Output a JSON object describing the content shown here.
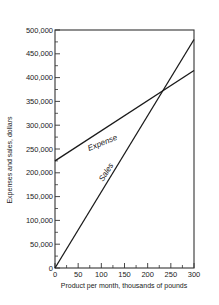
{
  "chart_data": {
    "type": "line",
    "title": "",
    "xlabel": "Product per month, thousands of pounds",
    "ylabel": "Expenses and sales, dollars",
    "xlim": [
      0,
      300
    ],
    "ylim": [
      0,
      500000
    ],
    "x_ticks": [
      0,
      50,
      100,
      150,
      200,
      250,
      300
    ],
    "x_tick_labels": [
      "0",
      "50",
      "100",
      "150",
      "200",
      "250",
      "300"
    ],
    "y_ticks": [
      0,
      50000,
      100000,
      150000,
      200000,
      250000,
      300000,
      350000,
      400000,
      450000,
      500000
    ],
    "y_tick_labels": [
      "0",
      "50,000",
      "100,000",
      "150,000",
      "200,000",
      "250,000",
      "300,000",
      "350,000",
      "400,000",
      "450,000",
      "500,000"
    ],
    "grid": false,
    "legend": "none (inline labels)",
    "series": [
      {
        "name": "Expense",
        "x": [
          0,
          300
        ],
        "values": [
          225000,
          415000
        ],
        "label_pos": {
          "x": 40,
          "y": 280000
        }
      },
      {
        "name": "Sales",
        "x": [
          0,
          300
        ],
        "values": [
          0,
          480000
        ],
        "label_pos": {
          "x": 105,
          "y": 215000
        }
      }
    ],
    "annotations": [
      {
        "text": "break-even intersection",
        "x": 231,
        "y": 374000
      }
    ]
  },
  "labels": {
    "expense": "Expense",
    "sales": "Sales",
    "xlabel": "Product per month, thousands of pounds",
    "ylabel": "Expenses and sales, dollars"
  }
}
